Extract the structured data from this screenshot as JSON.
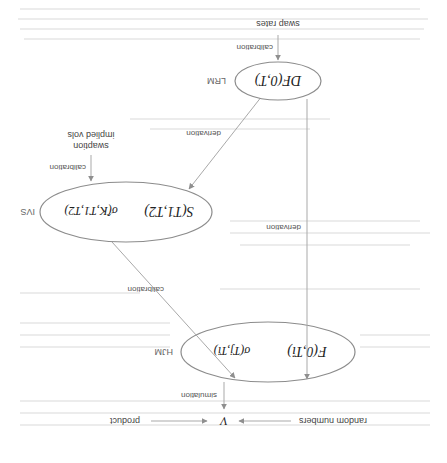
{
  "diagram": {
    "orientation": "rotated 180 degrees",
    "colors": {
      "edge": "#a9a9a9",
      "node_stroke": "#8c8c8c",
      "text": "#222222",
      "label": "#555555"
    },
    "nodes": {
      "lrm": {
        "model_label": "LRM",
        "content": "DF(0,T)"
      },
      "ivs": {
        "model_label": "IVS",
        "content_left": "S(T1,T2)",
        "content_right": "σ̂(K,T1,T2)"
      },
      "hjm": {
        "model_label": "HJM",
        "content_left": "F(0,Ti)",
        "content_right": "σ(Tj,Ti)"
      },
      "value": {
        "content": "V"
      }
    },
    "inputs": {
      "swap_rates": "swap rates",
      "swaption_vols_line1": "swaption",
      "swaption_vols_line2": "implied vols",
      "random_numbers": "random numbers",
      "product": "product"
    },
    "edges": {
      "swap_rates_to_lrm": "calibration",
      "lrm_to_ivs": "derivation",
      "lrm_to_hjm": "derivation",
      "vols_to_ivs": "calibration",
      "ivs_to_hjm": "calibration",
      "hjm_to_value": "simulation"
    }
  }
}
